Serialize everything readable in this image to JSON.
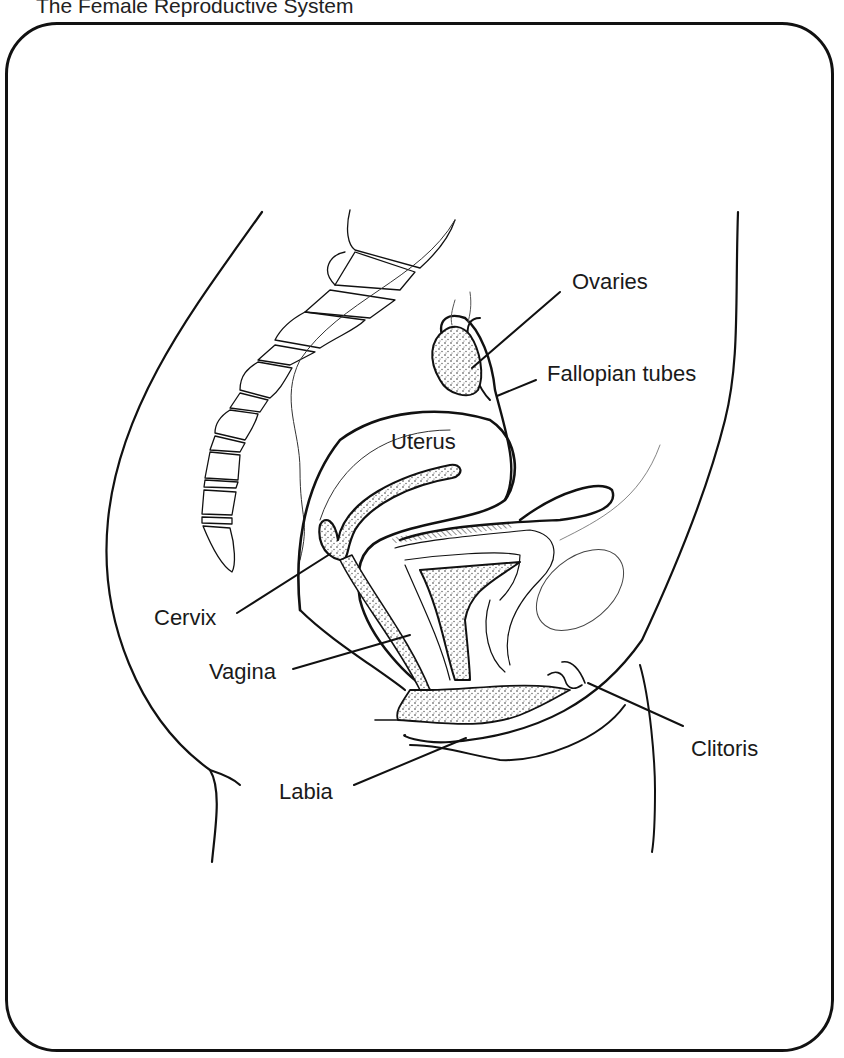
{
  "title": "The Female Reproductive System",
  "labels": {
    "ovaries": "Ovaries",
    "fallopian_tubes": "Fallopian tubes",
    "uterus": "Uterus",
    "cervix": "Cervix",
    "vagina": "Vagina",
    "labia": "Labia",
    "clitoris": "Clitoris"
  },
  "colors": {
    "ink": "#111111",
    "background": "#ffffff"
  }
}
